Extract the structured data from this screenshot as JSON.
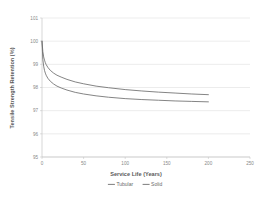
{
  "chart_data": {
    "type": "line",
    "title": "",
    "xlabel": "Service Life (Years)",
    "ylabel": "Tensile Strength Retention (%)",
    "xlim": [
      0,
      250
    ],
    "ylim": [
      95,
      101
    ],
    "xticks": [
      0,
      50,
      100,
      150,
      200,
      250
    ],
    "yticks": [
      95,
      96,
      97,
      98,
      99,
      100,
      101
    ],
    "xtick_labels": [
      "0",
      "50",
      "100",
      "150",
      "200",
      "250"
    ],
    "ytick_labels": [
      "95",
      "96",
      "97",
      "98",
      "99",
      "100",
      "101"
    ],
    "grid": "horizontal",
    "legend_position": "bottom",
    "series_color": "#6e6e6e",
    "grid_color": "#d9d9d9",
    "axis_color": "#bdbdbd",
    "series": [
      {
        "name": "Tubular",
        "x": [
          0,
          1,
          2,
          3,
          4,
          5,
          7,
          10,
          14,
          18,
          23,
          30,
          40,
          50,
          65,
          80,
          100,
          120,
          140,
          160,
          180,
          200
        ],
        "values": [
          100.0,
          99.55,
          99.32,
          99.18,
          99.07,
          98.99,
          98.87,
          98.74,
          98.62,
          98.53,
          98.45,
          98.35,
          98.24,
          98.16,
          98.06,
          97.99,
          97.91,
          97.85,
          97.8,
          97.76,
          97.72,
          97.69
        ]
      },
      {
        "name": "Solid",
        "x": [
          0,
          1,
          2,
          3,
          4,
          5,
          7,
          10,
          14,
          18,
          23,
          30,
          40,
          50,
          65,
          80,
          100,
          120,
          140,
          160,
          180,
          200
        ],
        "values": [
          100.0,
          99.2,
          98.92,
          98.74,
          98.62,
          98.53,
          98.4,
          98.27,
          98.15,
          98.06,
          97.98,
          97.89,
          97.79,
          97.72,
          97.64,
          97.58,
          97.52,
          97.48,
          97.45,
          97.42,
          97.4,
          97.38
        ]
      }
    ]
  },
  "legend": {
    "items": [
      {
        "label": "Tubular"
      },
      {
        "label": "Solid"
      }
    ]
  }
}
